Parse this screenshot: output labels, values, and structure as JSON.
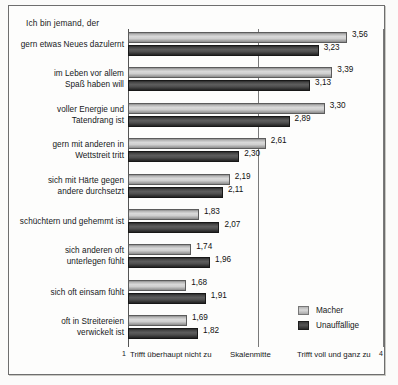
{
  "chart_data": {
    "type": "bar",
    "orientation": "horizontal",
    "title": "Ich bin jemand, der",
    "xlabel": "",
    "ylabel": "",
    "xlim": [
      1,
      4
    ],
    "grid": false,
    "legend_position": "bottom-right",
    "axis_captions": {
      "min_number": "1",
      "min_text": "Trifft überhaupt nicht zu",
      "mid_text": "Skalenmitte",
      "max_text": "Trifft voll und ganz zu",
      "max_number": "4"
    },
    "categories": [
      "gern etwas Neues dazulernt",
      "im Leben vor allem\nSpaß haben will",
      "voller Energie und\nTatendrang ist",
      "gern mit anderen in\nWettstreit tritt",
      "sich mit Härte gegen\nandere durchsetzt",
      "schüchtern und gehemmt ist",
      "sich anderen oft\nunterlegen fühlt",
      "sich oft einsam fühlt",
      "oft in Streitereien\nverwickelt ist"
    ],
    "series": [
      {
        "name": "Macher",
        "color": "#c9c9c9",
        "values": [
          3.56,
          3.39,
          3.3,
          2.61,
          2.19,
          1.83,
          1.74,
          1.68,
          1.69
        ],
        "labels": [
          "3,56",
          "3,39",
          "3,30",
          "2,61",
          "2,19",
          "1,83",
          "1,74",
          "1,68",
          "1,69"
        ]
      },
      {
        "name": "Unauffällige",
        "color": "#3a3a3a",
        "values": [
          3.23,
          3.13,
          2.89,
          2.3,
          2.11,
          2.07,
          1.96,
          1.91,
          1.82
        ],
        "labels": [
          "3,23",
          "3,13",
          "2,89",
          "2,30",
          "2,11",
          "2,07",
          "1,96",
          "1,91",
          "1,82"
        ]
      }
    ]
  },
  "legend": {
    "items": [
      {
        "label": "Macher"
      },
      {
        "label": "Unauffällige"
      }
    ]
  },
  "rows": [
    {
      "label": "gern etwas Neues dazulernt",
      "lines": 1,
      "macher": "3,56",
      "macher_v": 3.56,
      "unauff": "3,23",
      "unauff_v": 3.23
    },
    {
      "label": "im Leben vor allem\nSpaß haben will",
      "lines": 2,
      "macher": "3,39",
      "macher_v": 3.39,
      "unauff": "3,13",
      "unauff_v": 3.13
    },
    {
      "label": "voller Energie und\nTatendrang ist",
      "lines": 2,
      "macher": "3,30",
      "macher_v": 3.3,
      "unauff": "2,89",
      "unauff_v": 2.89
    },
    {
      "label": "gern mit anderen in\nWettstreit tritt",
      "lines": 2,
      "macher": "2,61",
      "macher_v": 2.61,
      "unauff": "2,30",
      "unauff_v": 2.3
    },
    {
      "label": "sich mit Härte gegen\nandere durchsetzt",
      "lines": 2,
      "macher": "2,19",
      "macher_v": 2.19,
      "unauff": "2,11",
      "unauff_v": 2.11
    },
    {
      "label": "schüchtern und gehemmt ist",
      "lines": 1,
      "macher": "1,83",
      "macher_v": 1.83,
      "unauff": "2,07",
      "unauff_v": 2.07
    },
    {
      "label": "sich anderen oft\nunterlegen fühlt",
      "lines": 2,
      "macher": "1,74",
      "macher_v": 1.74,
      "unauff": "1,96",
      "unauff_v": 1.96
    },
    {
      "label": "sich oft einsam fühlt",
      "lines": 1,
      "macher": "1,68",
      "macher_v": 1.68,
      "unauff": "1,91",
      "unauff_v": 1.91
    },
    {
      "label": "oft in Streitereien\nverwickelt ist",
      "lines": 2,
      "macher": "1,69",
      "macher_v": 1.69,
      "unauff": "1,82",
      "unauff_v": 1.82
    }
  ]
}
